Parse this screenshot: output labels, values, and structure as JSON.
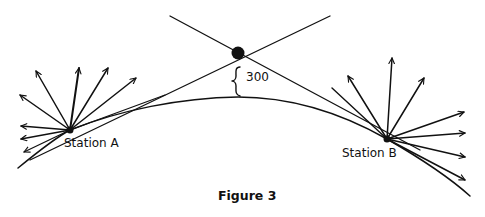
{
  "figure": {
    "caption": "Figure 3",
    "stations": [
      {
        "label": "Station A"
      },
      {
        "label": "Station B"
      }
    ],
    "height_annotation": "300",
    "markers": [
      "station-a-dot",
      "station-b-dot",
      "intersection-dot"
    ],
    "arrow_counts": {
      "station_a": 9,
      "station_b": 9
    }
  }
}
